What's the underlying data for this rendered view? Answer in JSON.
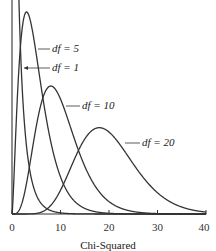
{
  "chart_data": {
    "type": "line",
    "title": "",
    "xlabel": "Chi-Squared",
    "ylabel": "",
    "xlim": [
      0,
      40
    ],
    "xticks": [
      0,
      10,
      20,
      30,
      40
    ],
    "grid": false,
    "legend": "inline annotations",
    "series": [
      {
        "name": "df = 1",
        "df": 1
      },
      {
        "name": "df = 5",
        "df": 5
      },
      {
        "name": "df = 10",
        "df": 10
      },
      {
        "name": "df = 20",
        "df": 20
      }
    ]
  },
  "labels": {
    "df1": "df = 1",
    "df5": "df = 5",
    "df10": "df = 10",
    "df20": "df = 20",
    "xlabel": "Chi-Squared",
    "ticks": [
      "0",
      "10",
      "20",
      "30",
      "40"
    ]
  }
}
